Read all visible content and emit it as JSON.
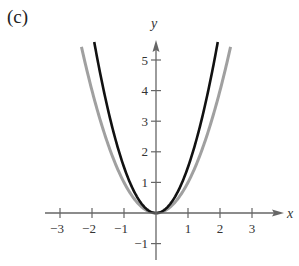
{
  "panel_label": "(c)",
  "chart_data": {
    "type": "line",
    "title": "",
    "xlabel": "x",
    "ylabel": "y",
    "xlim": [
      -3.5,
      4
    ],
    "ylim": [
      -1.5,
      5.8
    ],
    "grid": false,
    "legend": null,
    "x_ticks": [
      -3,
      -2,
      -1,
      1,
      2,
      3
    ],
    "x_tick_labels": [
      "−3",
      "−2",
      "−1",
      "1",
      "2",
      "3"
    ],
    "y_ticks": [
      -1,
      1,
      2,
      3,
      4,
      5
    ],
    "y_tick_labels": [
      "−1",
      "1",
      "2",
      "3",
      "4",
      "5"
    ],
    "series": [
      {
        "name": "y = x^2",
        "color": "#a0a0a0",
        "width": 3,
        "coef": 1.0,
        "domain": [
          -2.33,
          2.33
        ]
      },
      {
        "name": "y = 1.5x^2",
        "color": "#111111",
        "width": 2.6,
        "coef": 1.5,
        "domain": [
          -1.93,
          1.93
        ]
      }
    ],
    "axis_color": "#666666"
  }
}
